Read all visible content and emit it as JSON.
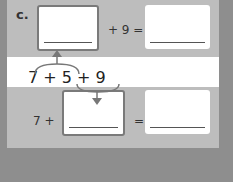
{
  "problem": {
    "label": "c.",
    "top_equation": {
      "operator": "+ 9 =",
      "blank1": "",
      "blank2": ""
    },
    "expression": "7  +  5  +  9",
    "bottom_equation": {
      "prefix": "7 +",
      "equals": "=",
      "blank1": "",
      "blank2": ""
    }
  },
  "colors": {
    "background": "#8e8e8e",
    "band": "#bdbdbd",
    "white": "#ffffff",
    "border": "#7a7a7a"
  }
}
